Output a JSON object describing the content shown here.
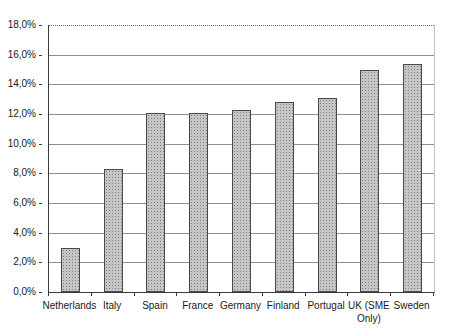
{
  "chart_data": {
    "type": "bar",
    "title": "",
    "xlabel": "",
    "ylabel": "",
    "categories": [
      "Netherlands",
      "Italy",
      "Spain",
      "France",
      "Germany",
      "Finland",
      "Portugal",
      "UK (SME Only)",
      "Sweden"
    ],
    "values": [
      3.0,
      8.3,
      12.1,
      12.1,
      12.3,
      12.8,
      13.1,
      15.0,
      15.4
    ],
    "ylim": [
      0,
      18
    ],
    "ytick_step": 2,
    "ytick_labels": [
      "0,0%",
      "2,0%",
      "4,0%",
      "6,0%",
      "8,0%",
      "10,0%",
      "12,0%",
      "14,0%",
      "16,0%",
      "18,0%"
    ],
    "grid": true,
    "top_gridline_style": "dotted",
    "legend": "none"
  },
  "style": {
    "background": "#ffffff",
    "bar_fill": "#c6c6c6",
    "bar_dot": "#7d7d7d",
    "bar_border": "#4a4a4a",
    "gridline_color": "#8f8f8f",
    "axis_color": "#3a3a3a",
    "text_color": "#1a1a1a"
  }
}
